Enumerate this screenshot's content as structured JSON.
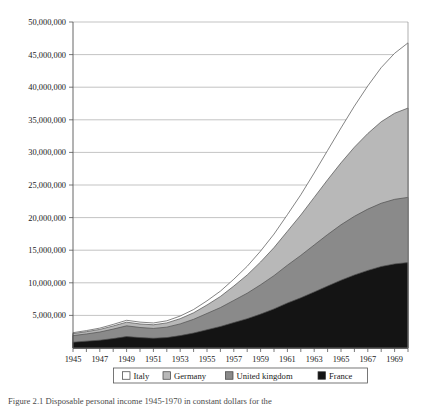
{
  "figure": {
    "caption": "Figure 2.1 Disposable personal income 1945-1970 in constant dollars for the"
  },
  "chart_data": {
    "type": "area",
    "stacked": true,
    "title": "",
    "xlabel": "",
    "ylabel": "",
    "grid": true,
    "legend_position": "bottom",
    "xlim": [
      1945,
      1970
    ],
    "ylim": [
      0,
      50000000
    ],
    "x": [
      1945,
      1946,
      1947,
      1948,
      1949,
      1950,
      1951,
      1952,
      1953,
      1954,
      1955,
      1956,
      1957,
      1958,
      1959,
      1960,
      1961,
      1962,
      1963,
      1964,
      1965,
      1966,
      1967,
      1968,
      1969,
      1970
    ],
    "xtick_labels": [
      "1945",
      "1947",
      "1949",
      "1951",
      "1953",
      "1955",
      "1957",
      "1959",
      "1961",
      "1963",
      "1965",
      "1967",
      "1969"
    ],
    "ytick_labels": [
      "5,000,000",
      "10,000,000",
      "15,000,000",
      "20,000,000",
      "25,000,000",
      "30,000,000",
      "35,000,000",
      "40,000,000",
      "45,000,000",
      "50,000,000"
    ],
    "ytick_values": [
      5000000,
      10000000,
      15000000,
      20000000,
      25000000,
      30000000,
      35000000,
      40000000,
      45000000,
      50000000
    ],
    "series": [
      {
        "name": "France",
        "color": "#141414",
        "order": 1,
        "values": [
          900000,
          1050000,
          1200000,
          1450000,
          1750000,
          1600000,
          1500000,
          1600000,
          1900000,
          2300000,
          2800000,
          3300000,
          3900000,
          4500000,
          5200000,
          6000000,
          6900000,
          7700000,
          8600000,
          9500000,
          10400000,
          11200000,
          11900000,
          12500000,
          12900000,
          13100000
        ]
      },
      {
        "name": "United kingdom",
        "color": "#8a8a8a",
        "order": 2,
        "values": [
          1000000,
          1100000,
          1250000,
          1450000,
          1650000,
          1550000,
          1500000,
          1600000,
          1800000,
          2100000,
          2500000,
          2900000,
          3400000,
          3900000,
          4500000,
          5100000,
          5800000,
          6500000,
          7200000,
          7900000,
          8500000,
          9000000,
          9400000,
          9700000,
          9900000,
          10000000
        ]
      },
      {
        "name": "Germany",
        "color": "#b8b8b8",
        "order": 3,
        "values": [
          300000,
          350000,
          400000,
          480000,
          560000,
          540000,
          560000,
          650000,
          800000,
          1000000,
          1300000,
          1700000,
          2200000,
          2800000,
          3500000,
          4300000,
          5200000,
          6200000,
          7300000,
          8400000,
          9500000,
          10600000,
          11600000,
          12500000,
          13200000,
          13700000
        ]
      },
      {
        "name": "Italy",
        "color": "#ffffff",
        "order": 4,
        "values": [
          150000,
          170000,
          200000,
          240000,
          290000,
          280000,
          280000,
          320000,
          400000,
          500000,
          640000,
          820000,
          1050000,
          1330000,
          1670000,
          2070000,
          2550000,
          3100000,
          3750000,
          4500000,
          5350000,
          6300000,
          7300000,
          8300000,
          9200000,
          10000000
        ]
      }
    ],
    "legend": [
      {
        "label": "Italy",
        "color": "#ffffff"
      },
      {
        "label": "Germany",
        "color": "#b8b8b8"
      },
      {
        "label": "United kingdom",
        "color": "#8a8a8a"
      },
      {
        "label": "France",
        "color": "#141414"
      }
    ]
  }
}
